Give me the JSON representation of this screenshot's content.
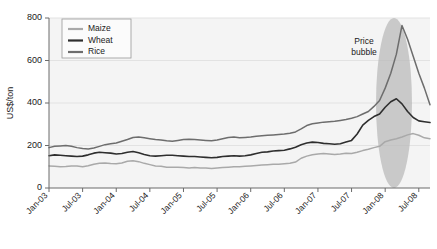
{
  "chart_data": {
    "type": "line",
    "title": "",
    "xlabel": "",
    "ylabel": "US$/ton",
    "ylim": [
      0,
      800
    ],
    "yticks": [
      0,
      200,
      400,
      600,
      800
    ],
    "grid": true,
    "legend_position": "top-left",
    "x": [
      "Jan-03",
      "Feb-03",
      "Mar-03",
      "Apr-03",
      "May-03",
      "Jun-03",
      "Jul-03",
      "Aug-03",
      "Sep-03",
      "Oct-03",
      "Nov-03",
      "Dec-03",
      "Jan-04",
      "Feb-04",
      "Mar-04",
      "Apr-04",
      "May-04",
      "Jun-04",
      "Jul-04",
      "Aug-04",
      "Sep-04",
      "Oct-04",
      "Nov-04",
      "Dec-04",
      "Jan-05",
      "Feb-05",
      "Mar-05",
      "Apr-05",
      "May-05",
      "Jun-05",
      "Jul-05",
      "Aug-05",
      "Sep-05",
      "Oct-05",
      "Nov-05",
      "Dec-05",
      "Jan-06",
      "Feb-06",
      "Mar-06",
      "Apr-06",
      "May-06",
      "Jun-06",
      "Jul-06",
      "Aug-06",
      "Sep-06",
      "Oct-06",
      "Nov-06",
      "Dec-06",
      "Jan-07",
      "Feb-07",
      "Mar-07",
      "Apr-07",
      "May-07",
      "Jun-07",
      "Jul-07",
      "Aug-07",
      "Sep-07",
      "Oct-07",
      "Nov-07",
      "Dec-07",
      "Jan-08",
      "Feb-08",
      "Mar-08",
      "Apr-08",
      "May-08",
      "Jun-08",
      "Jul-08",
      "Aug-08",
      "Sep-08"
    ],
    "xtick_labels": [
      "Jan-03",
      "Jul-03",
      "Jan-04",
      "Jul-04",
      "Jan-05",
      "Jul-05",
      "Jan-06",
      "Jul-06",
      "Jan-07",
      "Jul-07",
      "Jan-08",
      "Jul-08"
    ],
    "series": [
      {
        "name": "Maize",
        "color": "#a9a9a9",
        "values": [
          104,
          102,
          100,
          101,
          104,
          103,
          100,
          105,
          112,
          116,
          118,
          115,
          114,
          118,
          126,
          128,
          124,
          116,
          110,
          104,
          102,
          98,
          98,
          98,
          96,
          94,
          96,
          94,
          94,
          92,
          94,
          96,
          98,
          100,
          100,
          102,
          104,
          106,
          108,
          110,
          112,
          112,
          114,
          116,
          122,
          140,
          150,
          156,
          160,
          162,
          160,
          158,
          160,
          164,
          162,
          168,
          176,
          182,
          190,
          196,
          218,
          226,
          232,
          240,
          250,
          256,
          248,
          236,
          232
        ]
      },
      {
        "name": "Wheat",
        "color": "#2e2e2e",
        "values": [
          152,
          156,
          154,
          152,
          150,
          148,
          150,
          156,
          164,
          168,
          166,
          164,
          160,
          162,
          168,
          172,
          166,
          158,
          152,
          150,
          152,
          154,
          154,
          152,
          150,
          148,
          148,
          146,
          144,
          142,
          144,
          148,
          150,
          152,
          150,
          152,
          156,
          162,
          168,
          170,
          174,
          176,
          178,
          184,
          192,
          204,
          212,
          216,
          214,
          210,
          208,
          206,
          208,
          216,
          224,
          254,
          296,
          318,
          336,
          348,
          380,
          406,
          420,
          396,
          360,
          332,
          316,
          312,
          308
        ]
      },
      {
        "name": "Rice",
        "color": "#6d6d6d",
        "values": [
          190,
          196,
          198,
          200,
          196,
          190,
          186,
          184,
          188,
          196,
          204,
          208,
          212,
          220,
          228,
          238,
          240,
          236,
          232,
          228,
          226,
          222,
          220,
          224,
          228,
          230,
          228,
          226,
          224,
          222,
          226,
          232,
          238,
          240,
          236,
          238,
          240,
          244,
          246,
          248,
          250,
          252,
          254,
          258,
          264,
          278,
          294,
          302,
          306,
          310,
          312,
          314,
          318,
          322,
          328,
          336,
          348,
          360,
          384,
          412,
          470,
          540,
          630,
          765,
          700,
          620,
          540,
          470,
          392
        ]
      }
    ],
    "annotations": [
      {
        "name": "price-bubble",
        "text_line1": "Price",
        "text_line2": "bubble"
      }
    ]
  },
  "legend": {
    "items": [
      {
        "label": "Maize"
      },
      {
        "label": "Wheat"
      },
      {
        "label": "Rice"
      }
    ]
  },
  "colors": {
    "maize": "#a9a9a9",
    "wheat": "#2e2e2e",
    "rice": "#6d6d6d",
    "bubble_fill": "#b9b9b9",
    "plot_background": "#f4f4f4",
    "axis": "#6b6b6b",
    "grid": "#e2e2e2"
  }
}
